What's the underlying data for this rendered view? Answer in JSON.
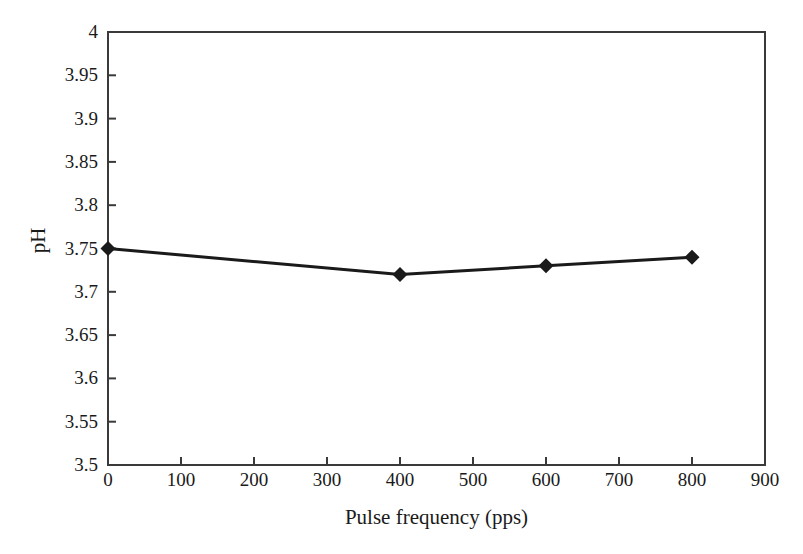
{
  "chart_data": {
    "type": "line",
    "title": "",
    "xlabel": "Pulse frequency (pps)",
    "ylabel": "pH",
    "x": [
      0,
      400,
      600,
      800
    ],
    "values": [
      3.75,
      3.72,
      3.73,
      3.74
    ],
    "series": [
      {
        "name": "pH",
        "x": [
          0,
          400,
          600,
          800
        ],
        "values": [
          3.75,
          3.72,
          3.73,
          3.74
        ],
        "color": "#1a1a1a",
        "marker": "diamond",
        "line_width": 3
      }
    ],
    "xlim": [
      0,
      900
    ],
    "ylim": [
      3.5,
      4.0
    ],
    "xticks": [
      0,
      100,
      200,
      300,
      400,
      500,
      600,
      700,
      800,
      900
    ],
    "xtick_labels": [
      "0",
      "100",
      "200",
      "300",
      "400",
      "500",
      "600",
      "700",
      "800",
      "900"
    ],
    "yticks": [
      3.5,
      3.55,
      3.6,
      3.65,
      3.7,
      3.75,
      3.8,
      3.85,
      3.9,
      3.95,
      4.0
    ],
    "ytick_labels": [
      "3.5",
      "3.55",
      "3.6",
      "3.65",
      "3.7",
      "3.75",
      "3.8",
      "3.85",
      "3.9",
      "3.95",
      "4"
    ],
    "grid": false,
    "legend": false,
    "legend_position": "none",
    "frame": true,
    "background_color": "#ffffff",
    "axis_color": "#3a3a3a"
  },
  "axes": {
    "y_title": "pH",
    "x_title": "Pulse frequency (pps)"
  }
}
